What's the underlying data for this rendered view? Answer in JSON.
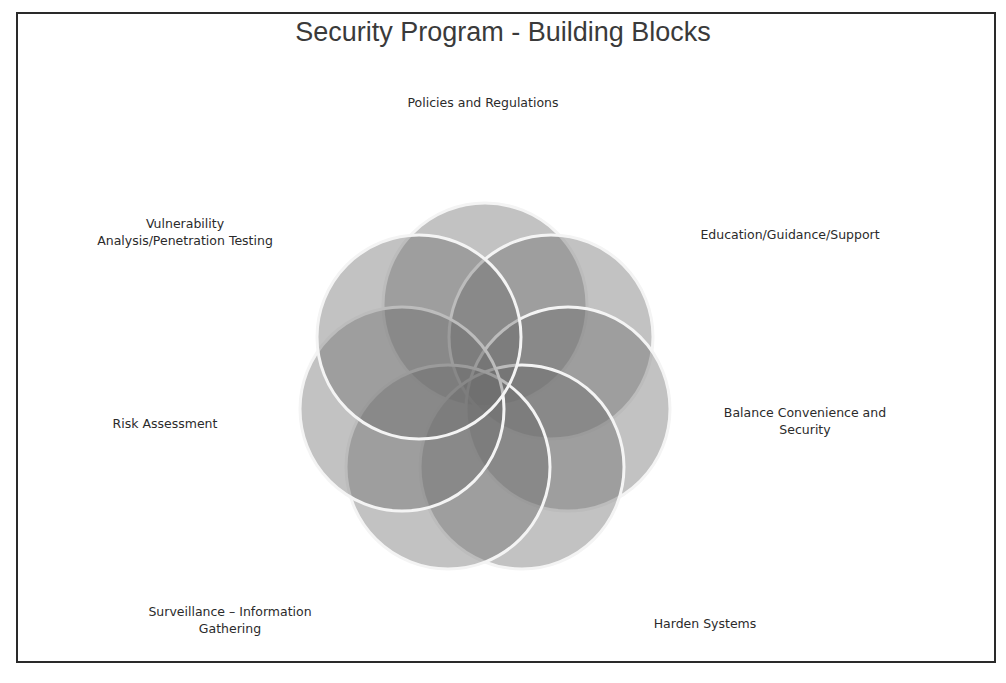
{
  "title": "Security Program - Building Blocks",
  "labels": {
    "policies": "Policies and Regulations",
    "education": "Education/Guidance/Support",
    "balance_1": "Balance Convenience and",
    "balance_2": "Security",
    "harden": "Harden Systems",
    "surveillance_1": "Surveillance – Information",
    "surveillance_2": "Gathering",
    "risk": "Risk Assessment",
    "vuln_1": "Vulnerability",
    "vuln_2": "Analysis/Penetration Testing"
  },
  "diagram": {
    "type": "overlapping-circles-flower",
    "petal_count": 7,
    "fill_color": "#6e6e6e",
    "stroke_color": "#ffffff"
  }
}
